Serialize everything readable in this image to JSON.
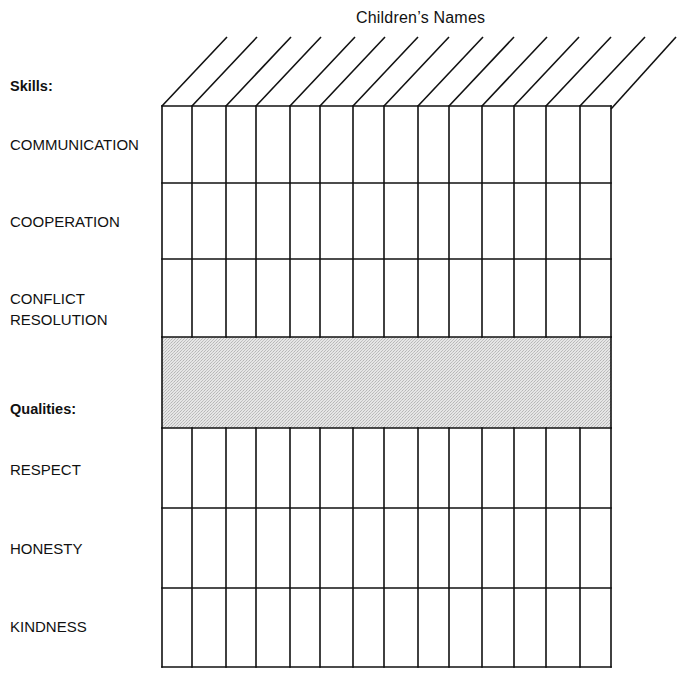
{
  "title": "Children’s Names",
  "sections": {
    "skills": {
      "heading": "Skills:",
      "items": [
        {
          "label": "COMMUNICATION"
        },
        {
          "label_line1": "COOPERATION"
        },
        {
          "label_line1": "CONFLICT",
          "label_line2": "RESOLUTION"
        }
      ]
    },
    "qualities": {
      "heading": "Qualities:",
      "items": [
        {
          "label": "RESPECT"
        },
        {
          "label": "HONESTY"
        },
        {
          "label": "KINDNESS"
        }
      ]
    }
  },
  "labels": {
    "communication": "COMMUNICATION",
    "cooperation": "COOPERATION",
    "conflict_line1": "CONFLICT",
    "conflict_line2": "RESOLUTION",
    "respect": "RESPECT",
    "honesty": "HONESTY",
    "kindness": "KINDNESS"
  },
  "grid": {
    "columns": 14,
    "column_x": [
      162,
      192,
      226,
      256,
      290,
      320,
      353,
      384,
      418,
      449,
      482,
      514,
      546,
      580,
      611
    ],
    "skills_rows_y": [
      106,
      183,
      259,
      337
    ],
    "separator_band_y": [
      337,
      428
    ],
    "qualities_rows_y": [
      428,
      508,
      588,
      667
    ],
    "diagonal_dx": 65,
    "diagonal_dy": -69,
    "line_color": "#111111",
    "band_color": "#d9d9d9"
  }
}
